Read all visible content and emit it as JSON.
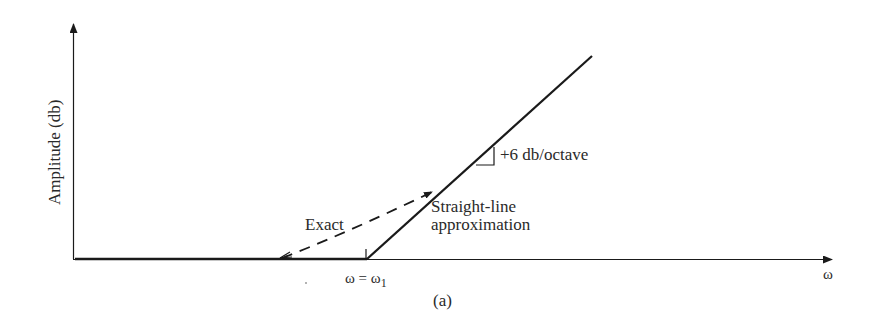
{
  "figure": {
    "panel_label": "(a)",
    "y_axis_label": "Amplitude (db)",
    "x_axis_label": "ω",
    "break_frequency_label": "ω = ω",
    "break_frequency_subscript": "1",
    "slope_annotation": "+6 db/octave",
    "curves": [
      {
        "name": "Exact",
        "style": "dashed"
      },
      {
        "name": "Straight-line approximation",
        "style": "solid"
      }
    ],
    "exact_label": "Exact",
    "approx_label_line1": "Straight-line",
    "approx_label_line2": "approximation"
  },
  "colors": {
    "ink": "#1a1a1a",
    "background": "#ffffff"
  }
}
